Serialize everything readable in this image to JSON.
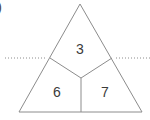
{
  "figure": {
    "item_label": ")",
    "background_color": "#ffffff",
    "line_color": "#8c8c8c",
    "dotted_color": "#8c8c8c",
    "number_color": "#3b3b3b",
    "triangle": {
      "apex": [
        80,
        4
      ],
      "base_left": [
        19,
        112
      ],
      "base_right": [
        142,
        112
      ]
    },
    "partition": {
      "center": [
        81,
        78
      ],
      "left_edge_point": [
        50,
        58
      ],
      "right_edge_point": [
        112,
        58
      ],
      "base_point": [
        81,
        112
      ]
    },
    "regions": [
      {
        "name": "top-region",
        "value": "3",
        "x": 80,
        "y": 49
      },
      {
        "name": "bottom-left-region",
        "value": "6",
        "x": 57,
        "y": 92
      },
      {
        "name": "bottom-right-region",
        "value": "7",
        "x": 105,
        "y": 92
      }
    ],
    "dotted_lines": [
      {
        "name": "left-dotted-line",
        "y": 58,
        "x1": 5,
        "x2": 47
      },
      {
        "name": "right-dotted-line",
        "y": 58,
        "x1": 116,
        "x2": 150
      }
    ]
  }
}
